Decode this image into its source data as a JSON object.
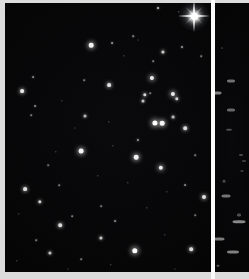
{
  "plate": {
    "background_color": "#e9e9e9",
    "sky_color": "#030303",
    "divider_color": "#fbfbfb",
    "star_color": "#ffffff",
    "width": 249,
    "height": 279
  },
  "main_panel": {
    "name": "star-field",
    "left": 5,
    "top": 3,
    "width": 206,
    "height": 269,
    "bright_star": {
      "x": 194,
      "y": 16,
      "size": 7,
      "spike_length": 32,
      "halo": 30
    },
    "stars": [
      {
        "x": 153,
        "y": 5,
        "r": 1.0,
        "b": 0.75
      },
      {
        "x": 174,
        "y": 9,
        "r": 0.7,
        "b": 0.45
      },
      {
        "x": 128,
        "y": 33,
        "r": 0.8,
        "b": 0.5
      },
      {
        "x": 86,
        "y": 42,
        "r": 2.3,
        "b": 0.95
      },
      {
        "x": 107,
        "y": 40,
        "r": 0.9,
        "b": 0.55
      },
      {
        "x": 177,
        "y": 44,
        "r": 1.0,
        "b": 0.6
      },
      {
        "x": 158,
        "y": 49,
        "r": 1.6,
        "b": 0.8
      },
      {
        "x": 196,
        "y": 53,
        "r": 0.8,
        "b": 0.45
      },
      {
        "x": 133,
        "y": 37,
        "r": 0.6,
        "b": 0.35
      },
      {
        "x": 119,
        "y": 53,
        "r": 0.7,
        "b": 0.4
      },
      {
        "x": 148,
        "y": 58,
        "r": 0.8,
        "b": 0.45
      },
      {
        "x": 28,
        "y": 74,
        "r": 0.9,
        "b": 0.5
      },
      {
        "x": 17,
        "y": 88,
        "r": 1.9,
        "b": 0.9
      },
      {
        "x": 79,
        "y": 77,
        "r": 0.8,
        "b": 0.45
      },
      {
        "x": 147,
        "y": 75,
        "r": 2.1,
        "b": 0.92
      },
      {
        "x": 104,
        "y": 82,
        "r": 1.9,
        "b": 0.88
      },
      {
        "x": 30,
        "y": 103,
        "r": 0.9,
        "b": 0.5
      },
      {
        "x": 26,
        "y": 112,
        "r": 0.8,
        "b": 0.45
      },
      {
        "x": 57,
        "y": 98,
        "r": 0.7,
        "b": 0.38
      },
      {
        "x": 145,
        "y": 90,
        "r": 0.8,
        "b": 0.45
      },
      {
        "x": 140,
        "y": 92,
        "r": 1.7,
        "b": 0.85
      },
      {
        "x": 168,
        "y": 91,
        "r": 2.1,
        "b": 0.92
      },
      {
        "x": 172,
        "y": 96,
        "r": 1.7,
        "b": 0.82
      },
      {
        "x": 138,
        "y": 98,
        "r": 1.5,
        "b": 0.75
      },
      {
        "x": 80,
        "y": 113,
        "r": 1.5,
        "b": 0.72
      },
      {
        "x": 168,
        "y": 114,
        "r": 1.4,
        "b": 0.7
      },
      {
        "x": 150,
        "y": 120,
        "r": 2.6,
        "b": 1.0
      },
      {
        "x": 157,
        "y": 120,
        "r": 2.3,
        "b": 0.96
      },
      {
        "x": 180,
        "y": 125,
        "r": 1.8,
        "b": 0.85
      },
      {
        "x": 104,
        "y": 119,
        "r": 0.7,
        "b": 0.4
      },
      {
        "x": 70,
        "y": 125,
        "r": 0.6,
        "b": 0.35
      },
      {
        "x": 133,
        "y": 137,
        "r": 1.1,
        "b": 0.6
      },
      {
        "x": 76,
        "y": 148,
        "r": 2.4,
        "b": 0.96
      },
      {
        "x": 51,
        "y": 149,
        "r": 0.7,
        "b": 0.38
      },
      {
        "x": 131,
        "y": 154,
        "r": 2.3,
        "b": 0.94
      },
      {
        "x": 108,
        "y": 143,
        "r": 0.7,
        "b": 0.4
      },
      {
        "x": 190,
        "y": 152,
        "r": 0.8,
        "b": 0.45
      },
      {
        "x": 156,
        "y": 165,
        "r": 2.2,
        "b": 0.92
      },
      {
        "x": 43,
        "y": 162,
        "r": 0.8,
        "b": 0.42
      },
      {
        "x": 93,
        "y": 173,
        "r": 0.7,
        "b": 0.38
      },
      {
        "x": 20,
        "y": 186,
        "r": 1.9,
        "b": 0.88
      },
      {
        "x": 54,
        "y": 182,
        "r": 0.8,
        "b": 0.45
      },
      {
        "x": 123,
        "y": 180,
        "r": 0.7,
        "b": 0.38
      },
      {
        "x": 180,
        "y": 182,
        "r": 0.9,
        "b": 0.5
      },
      {
        "x": 162,
        "y": 189,
        "r": 0.7,
        "b": 0.38
      },
      {
        "x": 199,
        "y": 194,
        "r": 2.0,
        "b": 0.88
      },
      {
        "x": 35,
        "y": 199,
        "r": 1.7,
        "b": 0.82
      },
      {
        "x": 96,
        "y": 203,
        "r": 0.8,
        "b": 0.45
      },
      {
        "x": 142,
        "y": 205,
        "r": 0.7,
        "b": 0.4
      },
      {
        "x": 14,
        "y": 211,
        "r": 0.7,
        "b": 0.38
      },
      {
        "x": 67,
        "y": 213,
        "r": 0.8,
        "b": 0.45
      },
      {
        "x": 55,
        "y": 222,
        "r": 1.8,
        "b": 0.85
      },
      {
        "x": 110,
        "y": 218,
        "r": 0.9,
        "b": 0.5
      },
      {
        "x": 190,
        "y": 212,
        "r": 0.8,
        "b": 0.42
      },
      {
        "x": 31,
        "y": 237,
        "r": 0.8,
        "b": 0.45
      },
      {
        "x": 96,
        "y": 235,
        "r": 1.6,
        "b": 0.78
      },
      {
        "x": 160,
        "y": 232,
        "r": 0.7,
        "b": 0.38
      },
      {
        "x": 130,
        "y": 248,
        "r": 2.7,
        "b": 1.0
      },
      {
        "x": 186,
        "y": 246,
        "r": 1.8,
        "b": 0.85
      },
      {
        "x": 45,
        "y": 250,
        "r": 1.6,
        "b": 0.76
      },
      {
        "x": 76,
        "y": 256,
        "r": 0.8,
        "b": 0.45
      },
      {
        "x": 12,
        "y": 258,
        "r": 0.7,
        "b": 0.38
      },
      {
        "x": 106,
        "y": 262,
        "r": 0.7,
        "b": 0.4
      },
      {
        "x": 63,
        "y": 266,
        "r": 0.6,
        "b": 0.35
      },
      {
        "x": 170,
        "y": 266,
        "r": 0.6,
        "b": 0.35
      }
    ]
  },
  "strip_panel": {
    "name": "spectrum-strip",
    "left": 215,
    "top": 3,
    "width": 34,
    "height": 269,
    "marks": [
      {
        "x": 16,
        "y": 78,
        "w": 8,
        "h": 3.0,
        "b": 0.5
      },
      {
        "x": 2,
        "y": 90,
        "w": 9,
        "h": 3.2,
        "b": 0.58
      },
      {
        "x": 16,
        "y": 107,
        "w": 8,
        "h": 2.8,
        "b": 0.46
      },
      {
        "x": 14,
        "y": 127,
        "w": 6,
        "h": 2.4,
        "b": 0.34
      },
      {
        "x": 26,
        "y": 152,
        "w": 4,
        "h": 2.0,
        "b": 0.3
      },
      {
        "x": 29,
        "y": 158,
        "w": 4,
        "h": 2.0,
        "b": 0.26
      },
      {
        "x": 9,
        "y": 178,
        "w": 3,
        "h": 2.6,
        "b": 0.3
      },
      {
        "x": 11,
        "y": 193,
        "w": 9,
        "h": 3.0,
        "b": 0.52
      },
      {
        "x": 24,
        "y": 212,
        "w": 4,
        "h": 3.2,
        "b": 0.34
      },
      {
        "x": 24,
        "y": 219,
        "w": 13,
        "h": 3.4,
        "b": 0.62
      },
      {
        "x": 4,
        "y": 236,
        "w": 11,
        "h": 3.2,
        "b": 0.56
      },
      {
        "x": 18,
        "y": 249,
        "w": 12,
        "h": 3.2,
        "b": 0.58
      },
      {
        "x": 3,
        "y": 263,
        "w": 3,
        "h": 2.4,
        "b": 0.38
      },
      {
        "x": 27,
        "y": 168,
        "w": 3,
        "h": 1.8,
        "b": 0.24
      },
      {
        "x": 7,
        "y": 45,
        "w": 2,
        "h": 1.8,
        "b": 0.18
      }
    ]
  }
}
